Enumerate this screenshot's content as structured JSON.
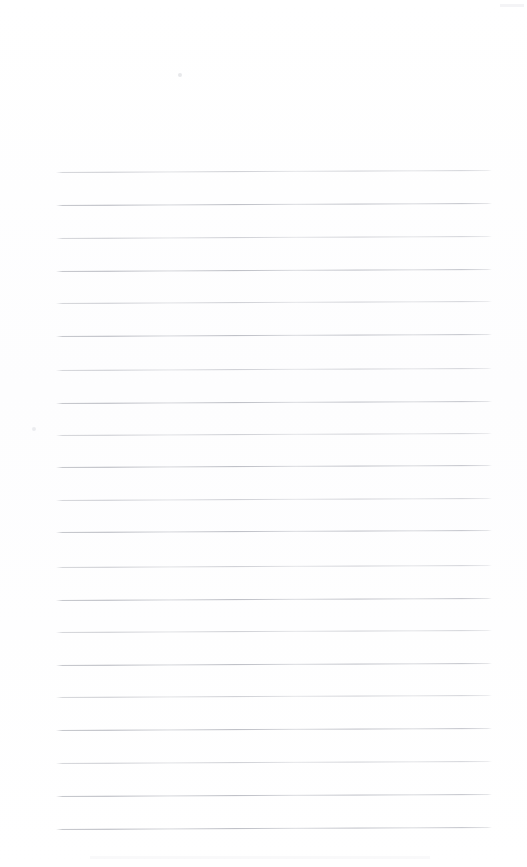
{
  "document": {
    "kind": "scanned-page",
    "title": "Blank Ruled Page",
    "content_text": "",
    "page_label": "",
    "background_color": "#ffffff",
    "rule_color": "#bcbec4",
    "paper_tone": "#fdfdfe"
  },
  "page": {
    "width": 527,
    "height": 867,
    "margin_top": 172,
    "margin_left": 56,
    "rule_right_edge": 492,
    "rule_spacing": 32.8,
    "rule_tilt_deg": -0.26,
    "rule_count": 21
  },
  "rules": [
    {
      "index": 1,
      "y": 172,
      "left": 56,
      "right": 492,
      "weight": "faint"
    },
    {
      "index": 2,
      "y": 205,
      "left": 56,
      "right": 492,
      "weight": "strong"
    },
    {
      "index": 3,
      "y": 238,
      "left": 56,
      "right": 492,
      "weight": "faint"
    },
    {
      "index": 4,
      "y": 271,
      "left": 56,
      "right": 492,
      "weight": "strong"
    },
    {
      "index": 5,
      "y": 303,
      "left": 56,
      "right": 492,
      "weight": "faint"
    },
    {
      "index": 6,
      "y": 336,
      "left": 56,
      "right": 492,
      "weight": "strong"
    },
    {
      "index": 7,
      "y": 370,
      "left": 56,
      "right": 492,
      "weight": "faint"
    },
    {
      "index": 8,
      "y": 403,
      "left": 56,
      "right": 492,
      "weight": "strong"
    },
    {
      "index": 9,
      "y": 435,
      "left": 56,
      "right": 492,
      "weight": "faint"
    },
    {
      "index": 10,
      "y": 467,
      "left": 56,
      "right": 492,
      "weight": "strong"
    },
    {
      "index": 11,
      "y": 500,
      "left": 56,
      "right": 492,
      "weight": "faint"
    },
    {
      "index": 12,
      "y": 532,
      "left": 56,
      "right": 492,
      "weight": "strong"
    },
    {
      "index": 13,
      "y": 567,
      "left": 56,
      "right": 492,
      "weight": "faint"
    },
    {
      "index": 14,
      "y": 600,
      "left": 56,
      "right": 492,
      "weight": "strong"
    },
    {
      "index": 15,
      "y": 632,
      "left": 56,
      "right": 492,
      "weight": "faint"
    },
    {
      "index": 16,
      "y": 665,
      "left": 56,
      "right": 492,
      "weight": "strong"
    },
    {
      "index": 17,
      "y": 697,
      "left": 56,
      "right": 492,
      "weight": "faint"
    },
    {
      "index": 18,
      "y": 730,
      "left": 56,
      "right": 492,
      "weight": "strong"
    },
    {
      "index": 19,
      "y": 763,
      "left": 56,
      "right": 492,
      "weight": "faint"
    },
    {
      "index": 20,
      "y": 796,
      "left": 56,
      "right": 492,
      "weight": "strong"
    },
    {
      "index": 21,
      "y": 829,
      "left": 56,
      "right": 492,
      "weight": "strong"
    }
  ],
  "artifacts": [
    {
      "name": "scan-speck-top-center",
      "x": 178,
      "y": 73,
      "size": 4
    },
    {
      "name": "scan-speck-left-margin",
      "x": 32,
      "y": 427,
      "size": 4
    }
  ]
}
